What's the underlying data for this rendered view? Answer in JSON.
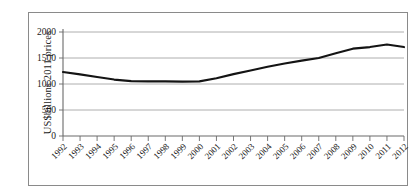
{
  "chart_data": {
    "type": "line",
    "title": "",
    "xlabel": "",
    "ylabel": "US$billions 2011 prices",
    "x": [
      "1992",
      "1993",
      "1994",
      "1995",
      "1996",
      "1997",
      "1998",
      "1999",
      "2000",
      "2001",
      "2002",
      "2003",
      "2004",
      "2005",
      "2006",
      "2007",
      "2008",
      "2009",
      "2010",
      "2011",
      "2012"
    ],
    "categories": [
      "1992",
      "1993",
      "1994",
      "1995",
      "1996",
      "1997",
      "1998",
      "1999",
      "2000",
      "2001",
      "2002",
      "2003",
      "2004",
      "2005",
      "2006",
      "2007",
      "2008",
      "2009",
      "2010",
      "2011",
      "2012"
    ],
    "values": [
      1230,
      1185,
      1135,
      1085,
      1055,
      1050,
      1050,
      1045,
      1050,
      1110,
      1190,
      1260,
      1330,
      1395,
      1450,
      1500,
      1590,
      1680,
      1710,
      1760,
      1710
    ],
    "series": [
      {
        "name": "World military expenditure",
        "values": [
          1230,
          1185,
          1135,
          1085,
          1055,
          1050,
          1050,
          1045,
          1050,
          1110,
          1190,
          1260,
          1330,
          1395,
          1450,
          1500,
          1590,
          1680,
          1710,
          1760,
          1710
        ]
      }
    ],
    "ylim": [
      0,
      2000
    ],
    "ytick_labels": [
      "0",
      "500",
      "1000",
      "1500",
      "2000"
    ],
    "ytick_values": [
      0,
      500,
      1000,
      1500,
      2000
    ],
    "grid": "horizontal",
    "legend": "none",
    "line_color": "#141414",
    "gridline_color": "#9a9a9a",
    "axis_color": "#6a6a6a",
    "frame_color": "#8a8a8a",
    "background": "#ffffff"
  }
}
